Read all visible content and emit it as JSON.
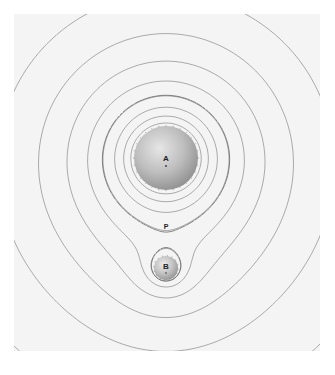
{
  "figure": {
    "panel": {
      "x": 14,
      "y": 14,
      "width": 306,
      "height": 337,
      "background": "#f4f4f4"
    },
    "line_color": "#8a8a8a",
    "dashed_color": "#6a6a6a"
  },
  "bodies": [
    {
      "id": "A",
      "label": "A",
      "cx": 166,
      "cy": 158,
      "r": 32,
      "mass": 9
    },
    {
      "id": "B",
      "label": "B",
      "cx": 166,
      "cy": 268,
      "r": 12,
      "mass": 1
    }
  ],
  "saddle_point": {
    "label": "P",
    "x": 166,
    "y": 232
  },
  "labels": {
    "A": "A",
    "B": "B",
    "P": "P"
  }
}
